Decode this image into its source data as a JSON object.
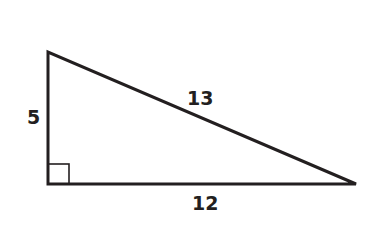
{
  "diagram": {
    "type": "right-triangle",
    "stroke_color": "#231f20",
    "vertices": {
      "top": [
        48,
        52
      ],
      "right_angle": [
        48,
        184
      ],
      "right": [
        356,
        184
      ]
    },
    "labels": {
      "vertical_leg": "5",
      "hypotenuse": "13",
      "horizontal_leg": "12"
    },
    "right_angle_marker": true
  }
}
